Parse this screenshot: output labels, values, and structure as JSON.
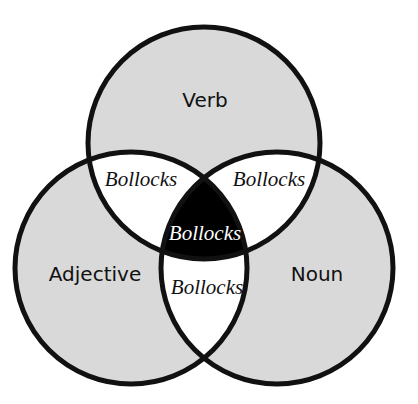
{
  "diagram": {
    "type": "venn-3",
    "colors": {
      "set_fill": "#d9d9d9",
      "pair_overlap_fill": "#ffffff",
      "triple_overlap_fill": "#000000",
      "stroke": "#111111",
      "label_text": "#111111",
      "triple_label_text": "#ffffff"
    },
    "sets": [
      {
        "id": "verb",
        "label": "Verb"
      },
      {
        "id": "adjective",
        "label": "Adjective"
      },
      {
        "id": "noun",
        "label": "Noun"
      }
    ],
    "regions": {
      "verb_adjective": "Bollocks",
      "verb_noun": "Bollocks",
      "verb_adjective_noun": "Bollocks",
      "adjective_noun": "Bollocks"
    }
  }
}
